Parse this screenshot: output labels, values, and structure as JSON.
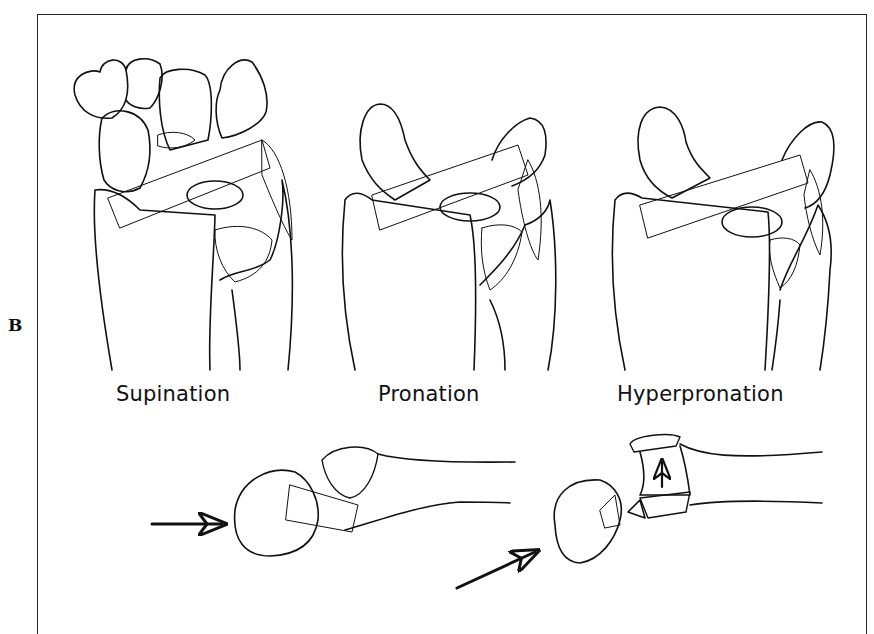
{
  "figure": {
    "panel_label": "B",
    "colors": {
      "ink": "#111111",
      "background": "#ffffff"
    },
    "top_row": [
      {
        "id": "supination",
        "caption": "Supination"
      },
      {
        "id": "pronation",
        "caption": "Pronation"
      },
      {
        "id": "hyperpronation",
        "caption": "Hyperpronation"
      }
    ],
    "bottom_row": [
      {
        "id": "lateral-pronation-view",
        "arrows": [
          "horizontal-arrow-right"
        ]
      },
      {
        "id": "lateral-hyperpronation-view",
        "arrows": [
          "diagonal-arrow-up-right",
          "vertical-arrow-up"
        ]
      }
    ]
  }
}
